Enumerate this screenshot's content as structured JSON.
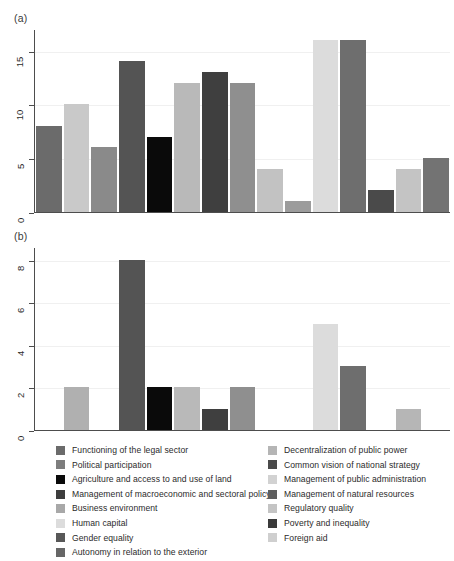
{
  "figure": {
    "panel_a_label": "(a)",
    "panel_b_label": "(b)"
  },
  "legend": {
    "left_column": [
      {
        "label": "Functioning of the legal sector",
        "color": "#6b6b6b"
      },
      {
        "label": "Political participation",
        "color": "#7d7d7d"
      },
      {
        "label": "Agriculture and access to and use of land",
        "color": "#0a0a0a"
      },
      {
        "label": "Management of macroeconomic and sectoral policy",
        "color": "#3d3d3d"
      },
      {
        "label": "Business environment",
        "color": "#a8a8a8"
      },
      {
        "label": "Human capital",
        "color": "#dcdcdc"
      },
      {
        "label": "Gender equality",
        "color": "#585858"
      },
      {
        "label": "Autonomy in relation to the exterior",
        "color": "#666666"
      }
    ],
    "right_column": [
      {
        "label": "Decentralization of public power",
        "color": "#b5b5b5"
      },
      {
        "label": "Common vision of national strategy",
        "color": "#4a4a4a"
      },
      {
        "label": "Management of public administration",
        "color": "#d2d2d2"
      },
      {
        "label": "Management of natural resources",
        "color": "#5e5e5e"
      },
      {
        "label": "Regulatory quality",
        "color": "#c4c4c4"
      },
      {
        "label": "Poverty and inequality",
        "color": "#3a3a3a"
      },
      {
        "label": "Foreign aid",
        "color": "#cfcfcf"
      }
    ]
  },
  "chart_data": [
    {
      "type": "bar",
      "panel": "(a)",
      "title": "",
      "xlabel": "",
      "ylabel": "",
      "ylim": [
        0,
        17
      ],
      "yticks": [
        0,
        5,
        10,
        15
      ],
      "ytick_labels": [
        "0",
        "5",
        "10",
        "15"
      ],
      "grid": true,
      "legend_position": "below",
      "categories": [
        "Functioning of the legal sector",
        "Political participation",
        "Decentralization of public power",
        "Common vision of national strategy",
        "Agriculture and access to and use of land",
        "Business environment",
        "Management of macroeconomic and sectoral policy",
        "Management of public administration",
        "Regulatory quality",
        "Gender equality",
        "Human capital",
        "Management of natural resources",
        "Poverty and inequality",
        "Foreign aid",
        "Autonomy in relation to the exterior"
      ],
      "values": [
        8,
        10,
        6,
        14,
        7,
        12,
        13,
        12,
        4,
        1,
        16,
        16,
        2,
        4,
        5
      ],
      "colors": [
        "#6b6b6b",
        "#c9c9c9",
        "#8a8a8a",
        "#545454",
        "#0a0a0a",
        "#b9b9b9",
        "#3f3f3f",
        "#8f8f8f",
        "#c2c2c2",
        "#9c9c9c",
        "#dcdcdc",
        "#6e6e6e",
        "#4a4a4a",
        "#c4c4c4",
        "#737373"
      ]
    },
    {
      "type": "bar",
      "panel": "(b)",
      "title": "",
      "xlabel": "",
      "ylabel": "",
      "ylim": [
        0,
        8.6
      ],
      "yticks": [
        0,
        2,
        4,
        6,
        8
      ],
      "ytick_labels": [
        "0",
        "2",
        "4",
        "6",
        "8"
      ],
      "grid": true,
      "legend_position": "below",
      "categories": [
        "Functioning of the legal sector",
        "Political participation",
        "Decentralization of public power",
        "Common vision of national strategy",
        "Agriculture and access to and use of land",
        "Business environment",
        "Management of macroeconomic and sectoral policy",
        "Management of public administration",
        "Regulatory quality",
        "Gender equality",
        "Human capital",
        "Management of natural resources",
        "Poverty and inequality",
        "Foreign aid",
        "Autonomy in relation to the exterior"
      ],
      "values": [
        0,
        2,
        0,
        8,
        2,
        2,
        1,
        2,
        0,
        0,
        5,
        3,
        0,
        1,
        0
      ],
      "colors": [
        "#6b6b6b",
        "#b0b0b0",
        "#8a8a8a",
        "#545454",
        "#0a0a0a",
        "#b9b9b9",
        "#3f3f3f",
        "#8f8f8f",
        "#c2c2c2",
        "#9c9c9c",
        "#dcdcdc",
        "#6e6e6e",
        "#4a4a4a",
        "#b6b6b6",
        "#737373"
      ]
    }
  ]
}
